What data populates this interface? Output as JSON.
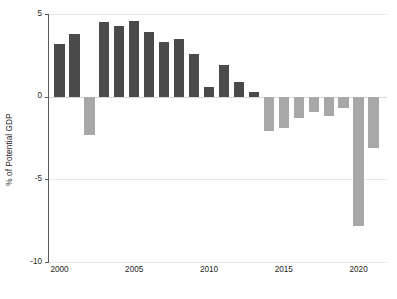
{
  "chart_data": {
    "type": "bar",
    "title": "",
    "subtitle": "",
    "xlabel": "",
    "ylabel": "% of Potential GDP",
    "categories": [
      2000,
      2001,
      2002,
      2003,
      2004,
      2005,
      2006,
      2007,
      2008,
      2009,
      2010,
      2011,
      2012,
      2013,
      2014,
      2015,
      2016,
      2017,
      2018,
      2019,
      2020,
      2021
    ],
    "values": [
      3.2,
      3.8,
      -2.3,
      4.5,
      4.3,
      4.6,
      3.9,
      3.3,
      3.5,
      2.6,
      0.6,
      1.9,
      0.9,
      0.3,
      -2.1,
      -1.9,
      -1.3,
      -0.9,
      -1.2,
      -0.7,
      -7.8,
      -3.1
    ],
    "bar_colors": [
      "#4a4a4a",
      "#4a4a4a",
      "#a8a8a8",
      "#4a4a4a",
      "#4a4a4a",
      "#4a4a4a",
      "#4a4a4a",
      "#4a4a4a",
      "#4a4a4a",
      "#4a4a4a",
      "#4a4a4a",
      "#4a4a4a",
      "#4a4a4a",
      "#4a4a4a",
      "#a8a8a8",
      "#a8a8a8",
      "#a8a8a8",
      "#a8a8a8",
      "#a8a8a8",
      "#a8a8a8",
      "#a8a8a8",
      "#a8a8a8"
    ],
    "ylim": [
      -10,
      5
    ],
    "xlim": [
      1999.3,
      2021.9
    ],
    "yticks": [
      5,
      0,
      -5,
      -10
    ],
    "ytick_labels": [
      "5",
      "0",
      "-5",
      "-10"
    ],
    "xticks": [
      2000,
      2005,
      2010,
      2015,
      2020
    ],
    "xtick_labels": [
      "2000",
      "2005",
      "2010",
      "2015",
      "2020"
    ],
    "grid": true,
    "grid_axis": "y",
    "legend": null,
    "legend_position": "none",
    "annotations": [],
    "colors": {
      "positive_bar": "#4a4a4a",
      "negative_bar": "#a8a8a8",
      "gridline": "#e9e9e9",
      "axis": "#5a5a5a",
      "text": "#262626",
      "background": "#ffffff"
    }
  }
}
